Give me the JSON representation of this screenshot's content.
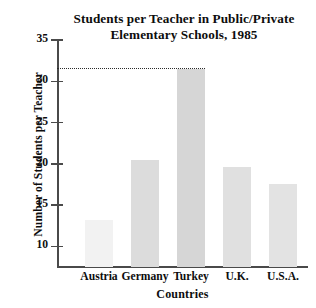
{
  "chart_data": {
    "type": "bar",
    "title": "Students per Teacher in Public/Private Elementary Schools, 1985",
    "title_line1": "Students per Teacher in Public/Private",
    "title_line2": "Elementary Schools, 1985",
    "xlabel": "Countries",
    "ylabel": "Number of Students per Teacher",
    "categories": [
      "Austria",
      "Germany",
      "Turkey",
      "U.K.",
      "U.S.A."
    ],
    "values": [
      13.2,
      20.5,
      31.5,
      19.6,
      17.6
    ],
    "bar_colors": [
      "#f2f2f2",
      "#dcdcdc",
      "#d6d6d6",
      "#e0e0e0",
      "#e3e3e3"
    ],
    "ylim": [
      7.5,
      35
    ],
    "yticks": [
      10,
      15,
      20,
      25,
      30,
      35
    ],
    "ytick_labels": [
      "10",
      "15",
      "20",
      "25",
      "30",
      "35"
    ],
    "grid": false,
    "legend": false,
    "annotations": [
      {
        "name": "turkey-reference-line",
        "type": "horizontal-dotted-line",
        "value": 31.5,
        "from_category": "Austria",
        "to_category": "Turkey",
        "color": "#2b2b2b"
      }
    ],
    "axis_color": "#4a4a4a",
    "background": "#ffffff"
  }
}
